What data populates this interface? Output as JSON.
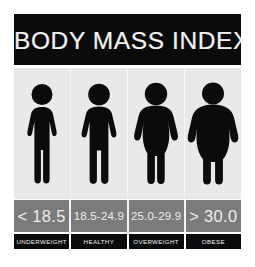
{
  "title": "BODY MASS INDEX",
  "colors": {
    "page_background": "#ffffff",
    "title_bar": "#0b0b0b",
    "title_text": "#f2f2f2",
    "figures_panel": "#e9e9e9",
    "figure_silhouette": "#0b0b0b",
    "range_band": "#7b7b7b",
    "range_text": "#ededed",
    "category_band": "#0b0b0b",
    "category_text": "#f0f0f0"
  },
  "columns": [
    {
      "range": "< 18.5",
      "category": "UNDERWEIGHT",
      "figure_icon": "person-slim-icon",
      "range_size": "wide"
    },
    {
      "range": "18.5-24.9",
      "category": "HEALTHY",
      "figure_icon": "person-healthy-icon",
      "range_size": "narrow"
    },
    {
      "range": "25.0-29.9",
      "category": "OVERWEIGHT",
      "figure_icon": "person-overweight-icon",
      "range_size": "narrow"
    },
    {
      "range": "> 30.0",
      "category": "OBESE",
      "figure_icon": "person-obese-icon",
      "range_size": "wide"
    }
  ]
}
